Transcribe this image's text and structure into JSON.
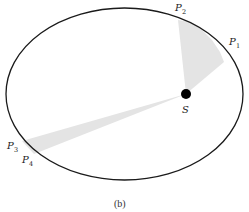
{
  "figure": {
    "caption": "(b)",
    "sun_label": "S",
    "points": [
      {
        "letter": "P",
        "sub": "1"
      },
      {
        "letter": "P",
        "sub": "2"
      },
      {
        "letter": "P",
        "sub": "3"
      },
      {
        "letter": "P",
        "sub": "4"
      }
    ],
    "colors": {
      "orbit": "#1a1a1a",
      "sweep": "#e4e4e4",
      "sun": "#000000"
    }
  }
}
